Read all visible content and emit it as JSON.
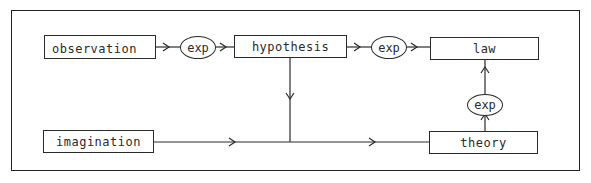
{
  "diagram": {
    "type": "flowchart",
    "nodes": {
      "observation": {
        "label": "observation",
        "shape": "rectangle"
      },
      "exp1": {
        "label": "exp",
        "shape": "ellipse"
      },
      "hypothesis": {
        "label": "hypothesis",
        "shape": "rectangle"
      },
      "exp2": {
        "label": "exp",
        "shape": "ellipse"
      },
      "law": {
        "label": "law",
        "shape": "rectangle"
      },
      "exp3": {
        "label": "exp",
        "shape": "ellipse"
      },
      "imagination": {
        "label": "imagination",
        "shape": "rectangle"
      },
      "theory": {
        "label": "theory",
        "shape": "rectangle"
      }
    },
    "edges": [
      {
        "from": "observation",
        "to": "exp1"
      },
      {
        "from": "exp1",
        "to": "hypothesis"
      },
      {
        "from": "hypothesis",
        "to": "exp2"
      },
      {
        "from": "exp2",
        "to": "law"
      },
      {
        "from": "hypothesis",
        "to": "theory",
        "via": "junction"
      },
      {
        "from": "imagination",
        "to": "theory",
        "via": "junction"
      },
      {
        "from": "theory",
        "to": "exp3"
      },
      {
        "from": "exp3",
        "to": "law"
      }
    ],
    "colors": {
      "line": "#2a2a2a",
      "background": "#ffffff"
    }
  }
}
